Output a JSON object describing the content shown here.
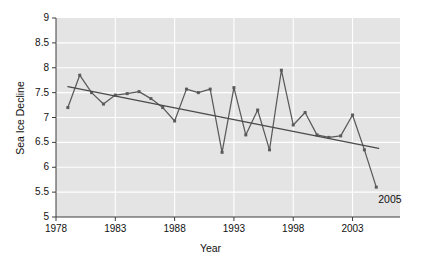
{
  "figure": {
    "background_color": "#ffffff",
    "plot_background_color": "#e4e4e4",
    "grid_color": "#ffffff",
    "line_color": "#5a5a5a",
    "trend_color": "#4a4a4a",
    "text_color": "#111111"
  },
  "chart_data": {
    "type": "line",
    "title": "",
    "xlabel": "Year",
    "ylabel": "Sea Ice Decline",
    "xlim": [
      1978,
      2007
    ],
    "ylim": [
      5,
      9
    ],
    "grid": true,
    "legend": "none",
    "xticks": [
      1978,
      1983,
      1988,
      1993,
      1998,
      2003
    ],
    "xtick_labels": [
      "1978",
      "1983",
      "1988",
      "1993",
      "1998",
      "2003"
    ],
    "yticks": [
      5,
      5.5,
      6,
      6.5,
      7,
      7.5,
      8,
      8.5,
      9
    ],
    "ytick_labels": [
      "5",
      "5.5",
      "6",
      "6.5",
      "7",
      "7.5",
      "8",
      "8.5",
      "9"
    ],
    "x": [
      1979,
      1980,
      1981,
      1982,
      1983,
      1984,
      1985,
      1986,
      1987,
      1988,
      1989,
      1990,
      1991,
      1992,
      1993,
      1994,
      1995,
      1996,
      1997,
      1998,
      1999,
      2000,
      2001,
      2002,
      2003,
      2004,
      2005
    ],
    "values": [
      7.2,
      7.85,
      7.5,
      7.27,
      7.45,
      7.48,
      7.52,
      7.38,
      7.2,
      6.93,
      7.57,
      7.5,
      7.57,
      6.3,
      7.6,
      6.65,
      7.15,
      6.35,
      7.95,
      6.85,
      7.1,
      6.65,
      6.6,
      6.63,
      7.05,
      6.35,
      5.6
    ],
    "series": [
      {
        "name": "Sea Ice Decline",
        "marker": "square",
        "values": [
          7.2,
          7.85,
          7.5,
          7.27,
          7.45,
          7.48,
          7.52,
          7.38,
          7.2,
          6.93,
          7.57,
          7.5,
          7.57,
          6.3,
          7.6,
          6.65,
          7.15,
          6.35,
          7.95,
          6.85,
          7.1,
          6.65,
          6.6,
          6.63,
          7.05,
          6.35,
          5.6
        ]
      },
      {
        "name": "Trend line",
        "marker": "none",
        "x": [
          1979,
          2005.2
        ],
        "values": [
          7.62,
          6.38
        ]
      }
    ],
    "annotations": [
      {
        "text": "2005",
        "x": 2005,
        "y": 5.6,
        "position": "below-right"
      }
    ]
  }
}
